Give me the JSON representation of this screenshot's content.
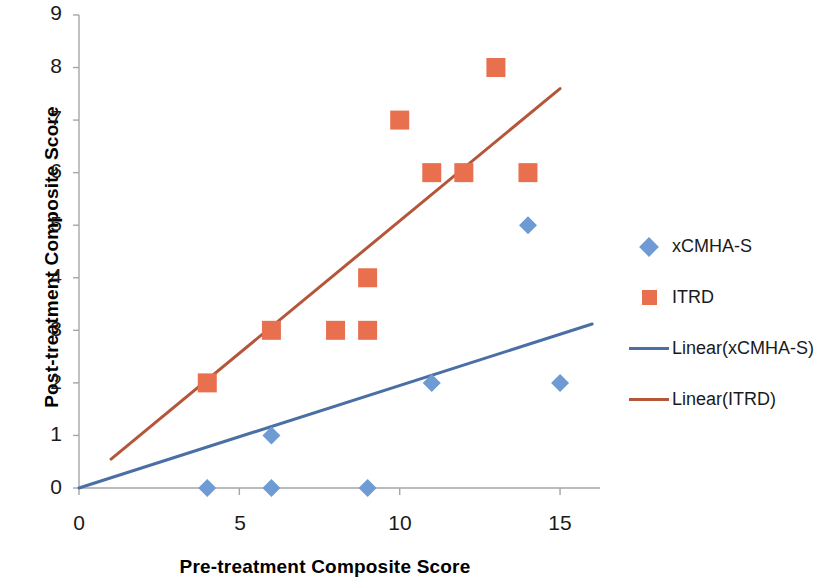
{
  "chart": {
    "type": "scatter",
    "title": "",
    "xlabel": "Pre-treatment Composite Score",
    "ylabel": "Post-treatment Composite Score",
    "x_ticks": [
      "0",
      "5",
      "10",
      "15"
    ],
    "y_ticks": [
      "0",
      "1",
      "2",
      "3",
      "4",
      "5",
      "6",
      "7",
      "8",
      "9"
    ]
  },
  "chart_data": {
    "type": "scatter",
    "title": "",
    "xlabel": "Pre-treatment Composite Score",
    "ylabel": "Post-treatment Composite Score",
    "xlim": [
      0,
      16.5
    ],
    "ylim": [
      0,
      9
    ],
    "xticks": [
      0,
      5,
      10,
      15
    ],
    "yticks": [
      0,
      1,
      2,
      3,
      4,
      5,
      6,
      7,
      8,
      9
    ],
    "grid": false,
    "legend_position": "right",
    "series": [
      {
        "name": "xCMHA-S",
        "marker": "diamond",
        "color": "#6E9BD4",
        "points": [
          {
            "x": 4,
            "y": 0
          },
          {
            "x": 6,
            "y": 0
          },
          {
            "x": 9,
            "y": 0
          },
          {
            "x": 4,
            "y": 2
          },
          {
            "x": 6,
            "y": 1
          },
          {
            "x": 9,
            "y": 4
          },
          {
            "x": 11,
            "y": 2
          },
          {
            "x": 14,
            "y": 5
          },
          {
            "x": 15,
            "y": 2
          }
        ]
      },
      {
        "name": "ITRD",
        "marker": "square",
        "color": "#E8704F",
        "points": [
          {
            "x": 4,
            "y": 2
          },
          {
            "x": 6,
            "y": 3
          },
          {
            "x": 8,
            "y": 3
          },
          {
            "x": 9,
            "y": 3
          },
          {
            "x": 9,
            "y": 4
          },
          {
            "x": 10,
            "y": 7
          },
          {
            "x": 11,
            "y": 6
          },
          {
            "x": 12,
            "y": 6
          },
          {
            "x": 13,
            "y": 8
          },
          {
            "x": 14,
            "y": 6
          }
        ]
      }
    ],
    "trendlines": [
      {
        "name": "Linear(xCMHA-S)",
        "color": "#4A6FA5",
        "x0": 0,
        "y0": 0,
        "x1": 16,
        "y1": 3.12
      },
      {
        "name": "Linear(ITRD)",
        "color": "#B5563B",
        "x0": 1,
        "y0": 0.55,
        "x1": 15,
        "y1": 7.6
      }
    ]
  },
  "legend": {
    "items": [
      {
        "label": "xCMHA-S",
        "key": "diamond-marker",
        "color": "#6E9BD4"
      },
      {
        "label": "ITRD",
        "key": "square-marker",
        "color": "#E8704F"
      },
      {
        "label": "Linear(xCMHA-S)",
        "key": "line-swatch",
        "color": "#4A6FA5"
      },
      {
        "label": "Linear(ITRD)",
        "key": "line-swatch",
        "color": "#B5563B"
      }
    ]
  }
}
